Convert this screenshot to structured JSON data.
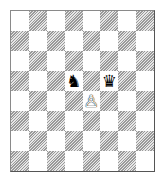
{
  "board": {
    "files": [
      "a",
      "b",
      "c",
      "d",
      "e",
      "f",
      "g",
      "h"
    ],
    "ranks": [
      8,
      7,
      6,
      5,
      4,
      3,
      2,
      1
    ],
    "top_left_color": "light",
    "colors": {
      "light": "#ffffff",
      "dark": "#9a9a9a"
    },
    "pieces": [
      {
        "square": "d5",
        "color": "black",
        "type": "knight",
        "glyph": "♞"
      },
      {
        "square": "f5",
        "color": "black",
        "type": "queen",
        "glyph": "♛"
      },
      {
        "square": "e4",
        "color": "white",
        "type": "pawn",
        "glyph": "♙"
      }
    ]
  }
}
